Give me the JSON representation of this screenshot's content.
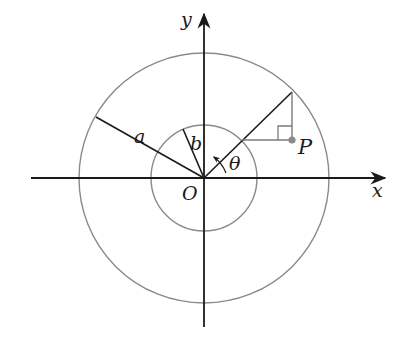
{
  "diagram": {
    "type": "polar-coordinate-annulus",
    "labels": {
      "x_axis": "x",
      "y_axis": "y",
      "origin": "O",
      "outer_radius": "a",
      "inner_radius": "b",
      "angle": "θ",
      "point": "P"
    },
    "colors": {
      "axis": "#1a1a1a",
      "circle": "#8a8a8a",
      "construction": "#7a7a7a",
      "point": "#8a8a8a"
    },
    "geometry": {
      "origin": [
        204,
        178
      ],
      "outer_circle_radius": 125,
      "inner_circle_radius": 53,
      "theta_degrees": 44
    }
  }
}
